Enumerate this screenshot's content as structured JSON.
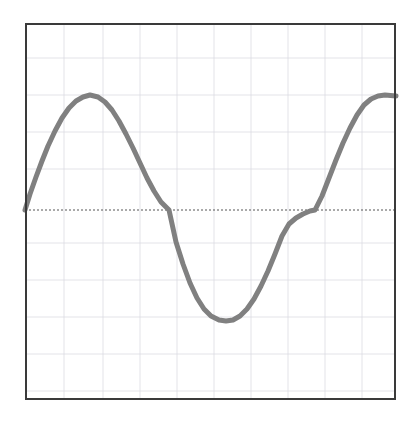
{
  "figure": {
    "background_color": "#ffffff",
    "width": 417,
    "height": 428
  },
  "plot_area": {
    "left": 25,
    "top": 23,
    "right": 396,
    "bottom": 400,
    "border_color": "#3a3a3a",
    "border_width": 2,
    "background_color": "#ffffff"
  },
  "grid": {
    "visible": true,
    "color": "#dcdce2",
    "line_width": 0.8,
    "x_positions": [
      64,
      103,
      140,
      177,
      214,
      251,
      288,
      325,
      362
    ],
    "y_positions": [
      58,
      95,
      132,
      169,
      243,
      280,
      317,
      354,
      391
    ]
  },
  "zero_axis": {
    "visible": true,
    "y_pixel": 210,
    "color": "#555555",
    "line_width": 1,
    "dash": "2,2"
  },
  "curve": {
    "color": "#808080",
    "line_width": 5,
    "line_cap": "round",
    "points_pixel": "25,210 30,194 36,177 42,161 48,146 55,131 62,118 69,108 76,101 83,97 90,95 98,97 105,102 112,110 119,121 126,134 133,148 140,163 147,178 154,191 161,202 169,210 176,242 183,264 190,283 197,298 204,309 211,316 219,320 226,321 233,320 240,316 247,309 254,299 261,286 268,271 275,254 282,236 289,224 296,218 303,214 310,211 315,210 322,196 329,178 336,160 343,143 350,128 357,115 364,105 371,99 378,96 385,95 396,96"
  },
  "chart_data": {
    "type": "line",
    "title": "",
    "xlabel": "",
    "ylabel": "",
    "grid": true,
    "legend": "none",
    "series_color": "#808080",
    "series": [
      {
        "name": "sine",
        "x": [
          0.0,
          0.05,
          0.1,
          0.15,
          0.2,
          0.25,
          0.3,
          0.35,
          0.4,
          0.45,
          0.5,
          0.55,
          0.6,
          0.65,
          0.7,
          0.75,
          0.8,
          0.85,
          0.9,
          0.95,
          1.0,
          1.05,
          1.1,
          1.15,
          1.2,
          1.25,
          1.3,
          1.35,
          1.4,
          1.45,
          1.5,
          1.55,
          1.6,
          1.65,
          1.7,
          1.75,
          1.8,
          1.85,
          1.9,
          1.95,
          2.0
        ],
        "y": [
          0.0,
          0.31,
          0.59,
          0.81,
          0.95,
          1.0,
          0.95,
          0.81,
          0.59,
          0.31,
          0.0,
          -0.31,
          -0.59,
          -0.81,
          -0.95,
          -1.0,
          -0.95,
          -0.81,
          -0.59,
          -0.31,
          0.0,
          0.31,
          0.59,
          0.81,
          0.95,
          1.0,
          0.95,
          0.81,
          0.59,
          0.31,
          0.0,
          -0.31,
          -0.59,
          -0.81,
          -0.95,
          -1.0,
          -0.95,
          -0.81,
          -0.59,
          -0.31,
          0.0
        ]
      }
    ],
    "xlim": [
      0,
      2.05
    ],
    "ylim": [
      -1.55,
      1.55
    ],
    "xticks": [],
    "yticks": [],
    "annotations": [
      {
        "label": "peak",
        "x_pixel": 98,
        "y_pixel": 96,
        "value": 1.0
      },
      {
        "label": "zero-crossing-1",
        "x_pixel": 169,
        "y_pixel": 210,
        "value": 0.0
      },
      {
        "label": "trough",
        "x_pixel": 248,
        "y_pixel": 321,
        "value": -1.0
      },
      {
        "label": "zero-crossing-2",
        "x_pixel": 315,
        "y_pixel": 210,
        "value": 0.0
      },
      {
        "label": "right-edge",
        "x_pixel": 396,
        "y_pixel": 96,
        "value": 1.0
      }
    ]
  }
}
